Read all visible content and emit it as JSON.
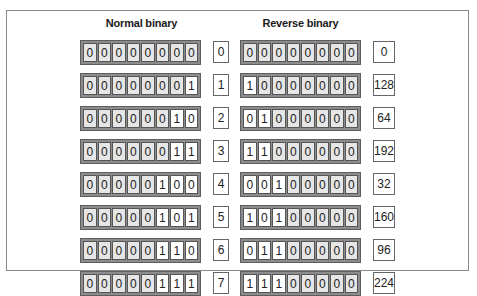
{
  "headings": {
    "normal": "Normal binary",
    "reverse": "Reverse binary"
  },
  "rows": [
    {
      "normal_bits": [
        "0",
        "0",
        "0",
        "0",
        "0",
        "0",
        "0",
        "0"
      ],
      "normal_dec": "0",
      "reverse_bits": [
        "0",
        "0",
        "0",
        "0",
        "0",
        "0",
        "0",
        "0"
      ],
      "reverse_dec": "0",
      "lit": 0
    },
    {
      "normal_bits": [
        "0",
        "0",
        "0",
        "0",
        "0",
        "0",
        "0",
        "1"
      ],
      "normal_dec": "1",
      "reverse_bits": [
        "1",
        "0",
        "0",
        "0",
        "0",
        "0",
        "0",
        "0"
      ],
      "reverse_dec": "128",
      "lit": 1
    },
    {
      "normal_bits": [
        "0",
        "0",
        "0",
        "0",
        "0",
        "0",
        "1",
        "0"
      ],
      "normal_dec": "2",
      "reverse_bits": [
        "0",
        "1",
        "0",
        "0",
        "0",
        "0",
        "0",
        "0"
      ],
      "reverse_dec": "64",
      "lit": 2
    },
    {
      "normal_bits": [
        "0",
        "0",
        "0",
        "0",
        "0",
        "0",
        "1",
        "1"
      ],
      "normal_dec": "3",
      "reverse_bits": [
        "1",
        "1",
        "0",
        "0",
        "0",
        "0",
        "0",
        "0"
      ],
      "reverse_dec": "192",
      "lit": 2
    },
    {
      "normal_bits": [
        "0",
        "0",
        "0",
        "0",
        "0",
        "1",
        "0",
        "0"
      ],
      "normal_dec": "4",
      "reverse_bits": [
        "0",
        "0",
        "1",
        "0",
        "0",
        "0",
        "0",
        "0"
      ],
      "reverse_dec": "32",
      "lit": 3
    },
    {
      "normal_bits": [
        "0",
        "0",
        "0",
        "0",
        "0",
        "1",
        "0",
        "1"
      ],
      "normal_dec": "5",
      "reverse_bits": [
        "1",
        "0",
        "1",
        "0",
        "0",
        "0",
        "0",
        "0"
      ],
      "reverse_dec": "160",
      "lit": 3
    },
    {
      "normal_bits": [
        "0",
        "0",
        "0",
        "0",
        "0",
        "1",
        "1",
        "0"
      ],
      "normal_dec": "6",
      "reverse_bits": [
        "0",
        "1",
        "1",
        "0",
        "0",
        "0",
        "0",
        "0"
      ],
      "reverse_dec": "96",
      "lit": 3
    },
    {
      "normal_bits": [
        "0",
        "0",
        "0",
        "0",
        "0",
        "1",
        "1",
        "1"
      ],
      "normal_dec": "7",
      "reverse_bits": [
        "1",
        "1",
        "1",
        "0",
        "0",
        "0",
        "0",
        "0"
      ],
      "reverse_dec": "224",
      "lit": 3
    }
  ],
  "colors": {
    "cell_off": "#e6e6e6",
    "cell_on": "#ffffff",
    "grid_border": "#8c8c8c",
    "frame": "#8a8a8a"
  }
}
